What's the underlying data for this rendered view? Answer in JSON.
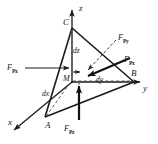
{
  "figure": {
    "domain": "Diagram",
    "background_color": "#ffffff",
    "stroke_color": "#1a1a1a",
    "dashed_color": "#555555",
    "axes": [
      {
        "id": "x",
        "label": "x",
        "label_x": 8,
        "label_y": 118
      },
      {
        "id": "y",
        "label": "y",
        "label_x": 143,
        "label_y": 84
      },
      {
        "id": "z",
        "label": "z",
        "label_x": 79,
        "label_y": 4
      }
    ],
    "vertices": [
      {
        "id": "A",
        "label": "A",
        "label_x": 45,
        "label_y": 121
      },
      {
        "id": "B",
        "label": "B",
        "label_x": 131,
        "label_y": 69
      },
      {
        "id": "C",
        "label": "C",
        "label_x": 63,
        "label_y": 18
      },
      {
        "id": "M",
        "label": "M",
        "label_x": 63,
        "label_y": 75
      }
    ],
    "differentials": [
      {
        "id": "dz",
        "label": "dz",
        "label_x": 73,
        "label_y": 47
      },
      {
        "id": "dy",
        "label": "dy",
        "label_x": 96,
        "label_y": 76
      },
      {
        "id": "dx",
        "label": "dx",
        "label_x": 42,
        "label_y": 90
      }
    ],
    "forces": [
      {
        "id": "FPx_left",
        "base": "F",
        "sub": "Px",
        "label_x": 7,
        "label_y": 64,
        "arrow_style": "solid-thin",
        "direction": "right"
      },
      {
        "id": "FPy",
        "base": "F",
        "sub": "Py",
        "label_x": 118,
        "label_y": 34,
        "arrow_style": "dashed-thin",
        "direction": "down-left"
      },
      {
        "id": "FPx_right",
        "base": "F",
        "sub": "Px",
        "label_x": 124,
        "label_y": 56,
        "arrow_style": "solid-thick",
        "direction": "left"
      },
      {
        "id": "FPz",
        "base": "F",
        "sub": "Pz",
        "label_x": 64,
        "label_y": 125,
        "arrow_style": "solid-thick",
        "direction": "up"
      }
    ]
  }
}
